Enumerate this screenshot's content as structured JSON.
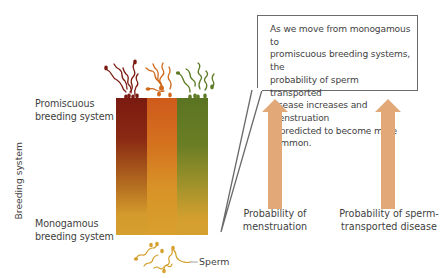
{
  "axis": {
    "y_label": "Breeding system"
  },
  "levels": {
    "top": {
      "line1": "Promiscuous",
      "line2": "breeding system"
    },
    "bottom": {
      "line1": "Monogamous",
      "line2": "breeding system"
    }
  },
  "gradient_block": {
    "columns": [
      {
        "name": "dark-red",
        "top_color": "#7b1a10",
        "bottom_color": "#d5a02f"
      },
      {
        "name": "orange",
        "top_color": "#cf5a1b",
        "bottom_color": "#d8a02e"
      },
      {
        "name": "olive-green",
        "top_color": "#5b7422",
        "bottom_color": "#d5a02f"
      }
    ]
  },
  "sperm": {
    "label": "Sperm",
    "top_colors": [
      "#7b1a10",
      "#d06a1e",
      "#5b7a22"
    ],
    "bottom_color": "#d5a02f"
  },
  "callout": {
    "lines": [
      "As we move from monogamous to",
      "promiscuous breeding systems, the",
      "probability of sperm transported",
      "disease increases and menstruation",
      "is predicted to become more common."
    ]
  },
  "arrows": [
    {
      "id": "menstruation",
      "line1": "Probability of",
      "line2": "menstruation",
      "color": "#e2a878"
    },
    {
      "id": "disease",
      "line1": "Probability of sperm-",
      "line2": "transported disease",
      "color": "#e2a878"
    }
  ],
  "colors": {
    "arrow": "#e2a878",
    "callout_border": "#6b6b6b",
    "text": "#3f3f3f"
  }
}
